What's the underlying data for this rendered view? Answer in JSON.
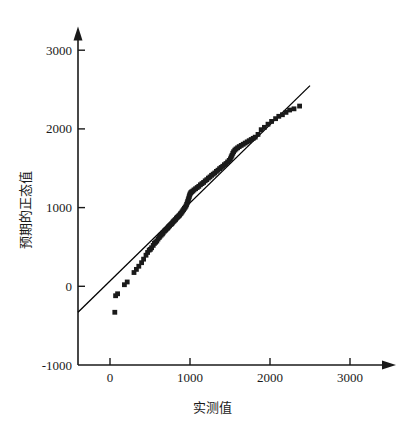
{
  "chart_data": {
    "type": "scatter",
    "title": "",
    "subtitle": "",
    "xlabel": "实测值",
    "ylabel": "预期的正态值",
    "xlim": [
      -400,
      3300
    ],
    "ylim": [
      -1000,
      3250
    ],
    "xticks": [
      0,
      1000,
      2000,
      3000
    ],
    "xtick_labels": [
      "0",
      "1000",
      "2000",
      "3000"
    ],
    "yticks": [
      -1000,
      0,
      1000,
      2000,
      3000
    ],
    "ytick_labels": [
      "-1000",
      "0",
      "1000",
      "2000",
      "3000"
    ],
    "grid": false,
    "legend": null,
    "legend_position": "none",
    "axis_style": "arrow-ended L-frame",
    "series": [
      {
        "name": "预期的正态值",
        "type": "scatter",
        "marker": "square-dot",
        "marker_size": 2.4,
        "color": "#1a1a1a",
        "points": [
          [
            60,
            -330
          ],
          [
            70,
            -120
          ],
          [
            95,
            -95
          ],
          [
            180,
            20
          ],
          [
            215,
            55
          ],
          [
            300,
            175
          ],
          [
            330,
            215
          ],
          [
            360,
            255
          ],
          [
            395,
            300
          ],
          [
            420,
            345
          ],
          [
            450,
            395
          ],
          [
            470,
            430
          ],
          [
            490,
            460
          ],
          [
            505,
            470
          ],
          [
            520,
            490
          ],
          [
            540,
            520
          ],
          [
            555,
            545
          ],
          [
            570,
            560
          ],
          [
            585,
            575
          ],
          [
            600,
            600
          ],
          [
            615,
            620
          ],
          [
            625,
            635
          ],
          [
            640,
            650
          ],
          [
            655,
            665
          ],
          [
            665,
            680
          ],
          [
            680,
            700
          ],
          [
            690,
            710
          ],
          [
            700,
            720
          ],
          [
            715,
            735
          ],
          [
            725,
            745
          ],
          [
            735,
            760
          ],
          [
            745,
            770
          ],
          [
            760,
            785
          ],
          [
            770,
            795
          ],
          [
            780,
            805
          ],
          [
            790,
            820
          ],
          [
            800,
            830
          ],
          [
            810,
            840
          ],
          [
            820,
            850
          ],
          [
            830,
            865
          ],
          [
            840,
            875
          ],
          [
            850,
            885
          ],
          [
            860,
            895
          ],
          [
            870,
            905
          ],
          [
            880,
            920
          ],
          [
            890,
            930
          ],
          [
            900,
            945
          ],
          [
            910,
            960
          ],
          [
            920,
            975
          ],
          [
            930,
            990
          ],
          [
            940,
            1005
          ],
          [
            950,
            1020
          ],
          [
            958,
            1040
          ],
          [
            965,
            1060
          ],
          [
            972,
            1080
          ],
          [
            978,
            1100
          ],
          [
            985,
            1120
          ],
          [
            990,
            1140
          ],
          [
            996,
            1160
          ],
          [
            1002,
            1175
          ],
          [
            1010,
            1190
          ],
          [
            1020,
            1200
          ],
          [
            1035,
            1210
          ],
          [
            1050,
            1225
          ],
          [
            1070,
            1240
          ],
          [
            1090,
            1255
          ],
          [
            1110,
            1270
          ],
          [
            1130,
            1290
          ],
          [
            1150,
            1305
          ],
          [
            1170,
            1320
          ],
          [
            1190,
            1340
          ],
          [
            1210,
            1355
          ],
          [
            1230,
            1375
          ],
          [
            1250,
            1390
          ],
          [
            1270,
            1410
          ],
          [
            1290,
            1425
          ],
          [
            1310,
            1440
          ],
          [
            1330,
            1460
          ],
          [
            1350,
            1475
          ],
          [
            1370,
            1495
          ],
          [
            1390,
            1510
          ],
          [
            1410,
            1525
          ],
          [
            1430,
            1545
          ],
          [
            1450,
            1560
          ],
          [
            1470,
            1580
          ],
          [
            1490,
            1600
          ],
          [
            1505,
            1620
          ],
          [
            1515,
            1645
          ],
          [
            1525,
            1665
          ],
          [
            1535,
            1690
          ],
          [
            1545,
            1710
          ],
          [
            1560,
            1730
          ],
          [
            1575,
            1745
          ],
          [
            1595,
            1760
          ],
          [
            1615,
            1775
          ],
          [
            1640,
            1790
          ],
          [
            1665,
            1805
          ],
          [
            1690,
            1820
          ],
          [
            1715,
            1835
          ],
          [
            1740,
            1850
          ],
          [
            1765,
            1865
          ],
          [
            1790,
            1880
          ],
          [
            1815,
            1895
          ],
          [
            1850,
            1930
          ],
          [
            1890,
            1990
          ],
          [
            1930,
            2020
          ],
          [
            1975,
            2060
          ],
          [
            2020,
            2095
          ],
          [
            2070,
            2130
          ],
          [
            2110,
            2160
          ],
          [
            2155,
            2180
          ],
          [
            2200,
            2210
          ],
          [
            2245,
            2240
          ],
          [
            2300,
            2255
          ],
          [
            2370,
            2290
          ]
        ]
      },
      {
        "name": "参考直线",
        "type": "line",
        "color": "#000000",
        "line_from": [
          -400,
          -330
        ],
        "line_to": [
          2500,
          2550
        ]
      }
    ]
  },
  "figure": {
    "background": "#ffffff",
    "axis_color": "#1a1a1a",
    "data_color": "#1a1a1a"
  }
}
